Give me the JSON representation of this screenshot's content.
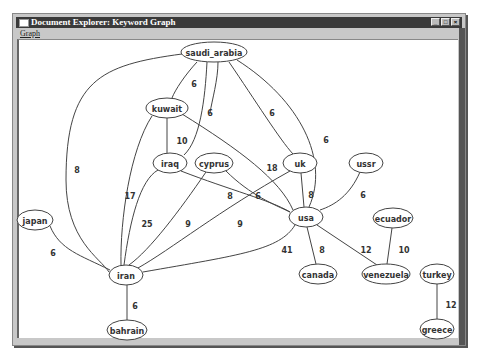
{
  "window": {
    "title": "Document Explorer: Keyword Graph",
    "controls": [
      "minimize",
      "maximize",
      "close"
    ]
  },
  "menubar": {
    "items": [
      {
        "label": "Graph"
      }
    ]
  },
  "graph": {
    "nodes": [
      {
        "id": "saudi_arabia",
        "label": "saudi_arabia",
        "x": 214,
        "y": 52,
        "rx": 33,
        "ry": 10
      },
      {
        "id": "kuwait",
        "label": "kuwait",
        "x": 167,
        "y": 108,
        "rx": 21,
        "ry": 10
      },
      {
        "id": "iraq",
        "label": "iraq",
        "x": 170,
        "y": 163,
        "rx": 17,
        "ry": 10
      },
      {
        "id": "cyprus",
        "label": "cyprus",
        "x": 214,
        "y": 163,
        "rx": 19,
        "ry": 10
      },
      {
        "id": "uk",
        "label": "uk",
        "x": 300,
        "y": 163,
        "rx": 17,
        "ry": 10
      },
      {
        "id": "ussr",
        "label": "ussr",
        "x": 366,
        "y": 163,
        "rx": 17,
        "ry": 10
      },
      {
        "id": "usa",
        "label": "usa",
        "x": 306,
        "y": 217,
        "rx": 17,
        "ry": 10
      },
      {
        "id": "ecuador",
        "label": "ecuador",
        "x": 393,
        "y": 218,
        "rx": 20,
        "ry": 10
      },
      {
        "id": "japan",
        "label": "japan",
        "x": 35,
        "y": 220,
        "rx": 18,
        "ry": 10
      },
      {
        "id": "iran",
        "label": "iran",
        "x": 126,
        "y": 275,
        "rx": 17,
        "ry": 10
      },
      {
        "id": "canada",
        "label": "canada",
        "x": 318,
        "y": 274,
        "rx": 19,
        "ry": 10
      },
      {
        "id": "venezuela",
        "label": "venezuela",
        "x": 386,
        "y": 274,
        "rx": 24,
        "ry": 10
      },
      {
        "id": "turkey",
        "label": "turkey",
        "x": 437,
        "y": 274,
        "rx": 17,
        "ry": 10
      },
      {
        "id": "bahrain",
        "label": "bahrain",
        "x": 127,
        "y": 330,
        "rx": 20,
        "ry": 10
      },
      {
        "id": "greece",
        "label": "greece",
        "x": 437,
        "y": 329,
        "rx": 17,
        "ry": 10
      }
    ],
    "edges": [
      {
        "d": "M182,54 C100,65 66,80 66,180 C66,240 100,258 109,272",
        "label": "8",
        "lx": 77,
        "ly": 170
      },
      {
        "d": "M197,62 C185,75 175,90 172,98",
        "label": "6",
        "lx": 194,
        "ly": 84
      },
      {
        "d": "M207,62 C205,100 200,140 184,155",
        "label": "10",
        "lx": 182,
        "ly": 141
      },
      {
        "d": "M218,62 C218,80 212,100 210,113",
        "label": "6",
        "lx": 210,
        "ly": 113
      },
      {
        "d": "M229,62 C255,100 280,140 293,154",
        "label": "6",
        "lx": 272,
        "ly": 113
      },
      {
        "d": "M237,60 C300,100 330,160 309,207",
        "label": "6",
        "lx": 326,
        "ly": 140
      },
      {
        "d": "M167,118 L167,153",
        "label": "",
        "lx": 0,
        "ly": 0
      },
      {
        "d": "M152,116 C130,150 120,220 121,265",
        "label": "17",
        "lx": 130,
        "ly": 196
      },
      {
        "d": "M182,114 C240,150 280,180 293,210",
        "label": "18",
        "lx": 272,
        "ly": 168
      },
      {
        "d": "M158,170 C140,180 130,220 124,265",
        "label": "25",
        "lx": 147,
        "ly": 224
      },
      {
        "d": "M181,171 C230,190 270,200 290,212",
        "label": "8",
        "lx": 230,
        "ly": 196
      },
      {
        "d": "M206,172 C180,210 150,250 129,265",
        "label": "9",
        "lx": 188,
        "ly": 224
      },
      {
        "d": "M226,171 C250,195 275,205 290,212",
        "label": "6",
        "lx": 258,
        "ly": 196
      },
      {
        "d": "M290,171 C220,210 170,250 138,268",
        "label": "9",
        "lx": 240,
        "ly": 224
      },
      {
        "d": "M301,173 L304,207",
        "label": "8",
        "lx": 311,
        "ly": 195
      },
      {
        "d": "M360,172 C350,195 335,205 320,210",
        "label": "6",
        "lx": 363,
        "ly": 195
      },
      {
        "d": "M295,225 C280,250 240,255 143,272",
        "label": "41",
        "lx": 287,
        "ly": 250
      },
      {
        "d": "M307,227 L316,264",
        "label": "8",
        "lx": 322,
        "ly": 250
      },
      {
        "d": "M317,225 L377,265",
        "label": "12",
        "lx": 366,
        "ly": 250
      },
      {
        "d": "M392,228 L387,264",
        "label": "10",
        "lx": 404,
        "ly": 250
      },
      {
        "d": "M50,226 C60,250 80,255 110,270",
        "label": "6",
        "lx": 53,
        "ly": 253
      },
      {
        "d": "M127,285 L127,320",
        "label": "6",
        "lx": 135,
        "ly": 306
      },
      {
        "d": "M437,284 L437,319",
        "label": "12",
        "lx": 451,
        "ly": 305
      }
    ]
  }
}
